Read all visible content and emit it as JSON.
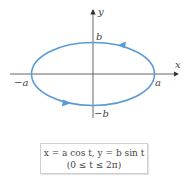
{
  "diagram": {
    "axes": {
      "x_label": "x",
      "y_label": "y"
    },
    "intercepts": {
      "pos_a": "a",
      "neg_a": "−a",
      "pos_b": "b",
      "neg_b": "−b"
    },
    "curve": {
      "type": "ellipse",
      "direction": "counterclockwise",
      "color": "#5b9bd5"
    },
    "axis_color": "#555555"
  },
  "caption": {
    "line1": "x = a cos t, y = b sin t",
    "line2": "(0 ≤ t ≤ 2π)"
  }
}
